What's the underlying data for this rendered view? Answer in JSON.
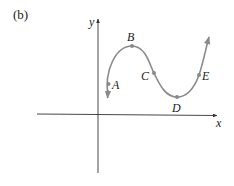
{
  "panel_label": "(b)",
  "axes": {
    "x_label": "x",
    "y_label": "y"
  },
  "curve_color": "#8a8a8a",
  "axis_color": "#333333",
  "points": [
    {
      "name": "A",
      "label": "A"
    },
    {
      "name": "B",
      "label": "B"
    },
    {
      "name": "C",
      "label": "C"
    },
    {
      "name": "D",
      "label": "D"
    },
    {
      "name": "E",
      "label": "E"
    }
  ]
}
